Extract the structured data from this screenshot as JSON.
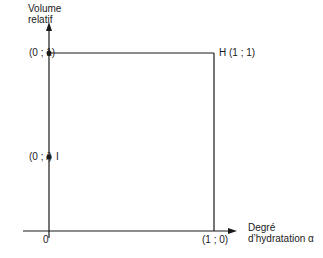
{
  "diagram": {
    "y_axis": {
      "label_line1": "Volume",
      "label_line2": "relatif"
    },
    "x_axis": {
      "label_line1": "Degré",
      "label_line2": "d’hydratation α"
    },
    "origin_label": "0",
    "points": {
      "top_left": "(0 ; 1)",
      "initial": "(0 ; i)",
      "initial_name": "I",
      "top_right": "H (1 ; 1)",
      "bottom_right": "(1 ; 0)"
    },
    "colors": {
      "line": "#1a1a1a",
      "background": "#ffffff"
    }
  }
}
